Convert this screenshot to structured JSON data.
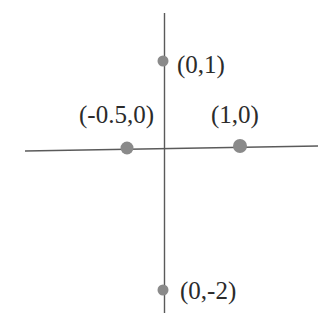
{
  "figure": {
    "background_color": "#ffffff",
    "axis_color": "#5a5a5a",
    "point_color": "#8a8a8a",
    "label_color": "#2b2b2b",
    "width": 326,
    "height": 321
  },
  "chart_data": {
    "type": "scatter",
    "title": "",
    "subtitle": "",
    "xlabel": "",
    "ylabel": "",
    "grid": false,
    "legend": false,
    "axes": {
      "x_axis": {
        "name": "x-axis",
        "x1": 25,
        "y1": 151,
        "x2": 318,
        "y2": 146,
        "ticks": [],
        "tick_labels": []
      },
      "y_axis": {
        "name": "y-axis",
        "x1": 164,
        "y1": 13,
        "x2": 164,
        "y2": 313,
        "ticks": [],
        "tick_labels": []
      },
      "origin": {
        "px": 164,
        "py": 148
      }
    },
    "points": [
      {
        "label": "(0,1)",
        "x": 0,
        "y": 1,
        "px": 163,
        "py": 61,
        "r": 5.5,
        "label_px": 177,
        "label_py": 52
      },
      {
        "label": "(-0.5,0)",
        "x": -0.5,
        "y": 0,
        "px": 127,
        "py": 148,
        "r": 6.5,
        "label_px": 79,
        "label_py": 102
      },
      {
        "label": "(1,0)",
        "x": 1,
        "y": 0,
        "px": 240,
        "py": 146,
        "r": 7.0,
        "label_px": 211,
        "label_py": 102
      },
      {
        "label": "(0,-2)",
        "x": 0,
        "y": -2,
        "px": 163,
        "py": 290,
        "r": 5.5,
        "label_px": 180,
        "label_py": 278
      }
    ],
    "annotations": [
      "(0,1)",
      "(-0.5,0)",
      "(1,0)",
      "(0,-2)"
    ]
  }
}
